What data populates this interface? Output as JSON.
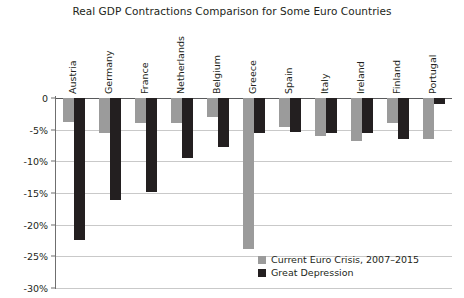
{
  "chart_data": {
    "type": "bar",
    "title": "Real GDP Contractions Comparison for Some Euro Countries",
    "xlabel": "",
    "ylabel": "",
    "ylim": [
      -30,
      0
    ],
    "yticks": [
      0,
      -5,
      -10,
      -15,
      -20,
      -25,
      -30
    ],
    "ytick_labels": [
      "0",
      "-5%",
      "-10%",
      "-15%",
      "-20%",
      "-25%",
      "-30%"
    ],
    "grid": true,
    "legend_position": "bottom-right",
    "categories": [
      "Austria",
      "Germany",
      "France",
      "Netherlands",
      "Belgium",
      "Greece",
      "Spain",
      "Italy",
      "Ireland",
      "Finland",
      "Portugal"
    ],
    "series": [
      {
        "name": "Current Euro Crisis, 2007–2015",
        "color": "#9b9b9b",
        "values": [
          -3.8,
          -5.5,
          -4.0,
          -4.0,
          -3.0,
          -23.8,
          -4.5,
          -6.0,
          -6.8,
          -4.0,
          -6.4
        ]
      },
      {
        "name": "Great Depression",
        "color": "#231f20",
        "values": [
          -22.4,
          -16.1,
          -14.8,
          -9.5,
          -7.8,
          -5.6,
          -5.3,
          -5.5,
          -5.5,
          -6.5,
          -1.0
        ]
      }
    ]
  },
  "legend": {
    "items": [
      {
        "label": "Current Euro Crisis, 2007–2015",
        "color": "#9b9b9b"
      },
      {
        "label": "Great Depression",
        "color": "#231f20"
      }
    ]
  }
}
